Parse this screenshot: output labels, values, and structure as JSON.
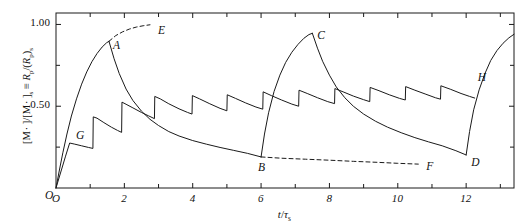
{
  "chart_data": {
    "type": "line",
    "title": "",
    "xlabel": "t/τs",
    "xlabel_parts": {
      "var": "t",
      "slash": "/",
      "tau": "τ",
      "sub": "s"
    },
    "ylabel": "[M · ]/[M · ]s ≡ Rp/(Rp)s",
    "ylabel_parts": {
      "open1": "[M",
      "dot1": "·",
      "close1": " ]/[M",
      "dot2": "·",
      "close2": " ]",
      "sub_s1": "s",
      "equiv": "≡",
      "R1": "R",
      "sub_p1": "p",
      "slash": "/(",
      "R2": "R",
      "sub_p2": "p",
      "close3": ")",
      "sub_s2": "s"
    },
    "xlim": [
      0,
      13.4
    ],
    "ylim": [
      0,
      1.07
    ],
    "xticks_major": [
      0,
      2,
      4,
      6,
      8,
      10,
      12
    ],
    "xticks_minor": [
      1,
      3,
      5,
      7,
      9,
      11,
      13
    ],
    "xtick_labels": [
      "O",
      "2",
      "4",
      "6",
      "8",
      "10",
      "12"
    ],
    "yticks_major": [
      0.5,
      1.0
    ],
    "ytick_labels": [
      "0.50",
      "1.00"
    ],
    "yticks_minor": [
      0.25,
      0.75
    ],
    "grid": false,
    "legend": null,
    "frame": "box",
    "tick_direction": "in",
    "annotations": [
      {
        "label": "O",
        "x": 0.0,
        "y": 0.0,
        "note": "origin"
      },
      {
        "label": "G",
        "x": 0.5,
        "y": 0.275,
        "note": "start of lower sawtooth envelope"
      },
      {
        "label": "A",
        "x": 1.55,
        "y": 0.895,
        "note": "first major peak"
      },
      {
        "label": "E",
        "x": 2.75,
        "y": 1.0,
        "note": "end of dashed ideal curve, segment 1"
      },
      {
        "label": "B",
        "x": 6.0,
        "y": 0.185,
        "note": "minimum before second growth"
      },
      {
        "label": "C",
        "x": 7.5,
        "y": 0.945,
        "note": "second major peak"
      },
      {
        "label": "F",
        "x": 10.6,
        "y": 0.145,
        "note": "end of dashed lower curve"
      },
      {
        "label": "D",
        "x": 12.0,
        "y": 0.2,
        "note": "minimum before third growth"
      },
      {
        "label": "H",
        "x": 12.25,
        "y": 0.625,
        "note": "upper branch marker, third cycle"
      }
    ],
    "series": [
      {
        "name": "main-trace",
        "style": "solid",
        "points": [
          [
            0.0,
            0.0
          ],
          [
            0.28,
            0.195
          ],
          [
            0.4,
            0.275
          ],
          [
            0.55,
            0.268
          ],
          [
            0.75,
            0.258
          ],
          [
            0.95,
            0.248
          ],
          [
            1.08,
            0.242
          ],
          [
            1.09,
            0.435
          ],
          [
            1.2,
            0.427
          ],
          [
            1.4,
            0.4
          ],
          [
            1.62,
            0.372
          ],
          [
            1.8,
            0.352
          ],
          [
            1.92,
            0.34
          ],
          [
            1.93,
            0.525
          ],
          [
            2.05,
            0.512
          ],
          [
            2.25,
            0.49
          ],
          [
            2.5,
            0.462
          ],
          [
            2.7,
            0.442
          ],
          [
            2.88,
            0.424
          ],
          [
            2.89,
            0.56
          ],
          [
            3.05,
            0.545
          ],
          [
            3.3,
            0.515
          ],
          [
            3.6,
            0.484
          ],
          [
            3.85,
            0.462
          ],
          [
            3.98,
            0.452
          ],
          [
            3.99,
            0.565
          ],
          [
            4.2,
            0.545
          ],
          [
            4.5,
            0.515
          ],
          [
            4.8,
            0.487
          ],
          [
            5.0,
            0.472
          ],
          [
            5.01,
            0.57
          ],
          [
            5.25,
            0.548
          ],
          [
            5.55,
            0.52
          ],
          [
            5.85,
            0.495
          ],
          [
            6.05,
            0.482
          ],
          [
            6.06,
            0.588
          ],
          [
            6.3,
            0.565
          ],
          [
            6.6,
            0.538
          ],
          [
            6.9,
            0.513
          ],
          [
            7.1,
            0.5
          ],
          [
            7.11,
            0.598
          ],
          [
            7.35,
            0.578
          ],
          [
            7.65,
            0.552
          ],
          [
            7.95,
            0.528
          ],
          [
            8.15,
            0.516
          ],
          [
            8.16,
            0.608
          ],
          [
            8.4,
            0.588
          ],
          [
            8.7,
            0.562
          ],
          [
            9.0,
            0.54
          ],
          [
            9.18,
            0.528
          ],
          [
            9.19,
            0.615
          ],
          [
            9.45,
            0.595
          ],
          [
            9.75,
            0.57
          ],
          [
            10.05,
            0.548
          ],
          [
            10.22,
            0.538
          ],
          [
            10.23,
            0.62
          ],
          [
            10.5,
            0.598
          ],
          [
            10.8,
            0.575
          ],
          [
            11.1,
            0.552
          ],
          [
            11.25,
            0.543
          ],
          [
            11.26,
            0.625
          ],
          [
            11.55,
            0.603
          ],
          [
            11.85,
            0.578
          ],
          [
            12.1,
            0.56
          ],
          [
            12.25,
            0.55
          ]
        ]
      },
      {
        "name": "growth-branch-1",
        "style": "solid",
        "note": "O to A rising curve",
        "points": [
          [
            0.0,
            0.0
          ],
          [
            0.1,
            0.11
          ],
          [
            0.2,
            0.215
          ],
          [
            0.32,
            0.33
          ],
          [
            0.45,
            0.44
          ],
          [
            0.6,
            0.545
          ],
          [
            0.75,
            0.635
          ],
          [
            0.9,
            0.71
          ],
          [
            1.05,
            0.772
          ],
          [
            1.2,
            0.822
          ],
          [
            1.35,
            0.862
          ],
          [
            1.48,
            0.888
          ],
          [
            1.55,
            0.897
          ]
        ]
      },
      {
        "name": "decay-branch-1",
        "style": "solid",
        "note": "A down to B",
        "points": [
          [
            1.55,
            0.897
          ],
          [
            1.7,
            0.79
          ],
          [
            1.85,
            0.7
          ],
          [
            2.05,
            0.605
          ],
          [
            2.25,
            0.535
          ],
          [
            2.5,
            0.47
          ],
          [
            2.75,
            0.42
          ],
          [
            3.0,
            0.382
          ],
          [
            3.3,
            0.345
          ],
          [
            3.6,
            0.318
          ],
          [
            4.0,
            0.29
          ],
          [
            4.4,
            0.268
          ],
          [
            4.8,
            0.248
          ],
          [
            5.2,
            0.23
          ],
          [
            5.6,
            0.212
          ],
          [
            6.0,
            0.19
          ]
        ]
      },
      {
        "name": "growth-branch-2",
        "style": "solid",
        "note": "B up to C",
        "points": [
          [
            6.0,
            0.19
          ],
          [
            6.1,
            0.33
          ],
          [
            6.22,
            0.46
          ],
          [
            6.38,
            0.59
          ],
          [
            6.55,
            0.69
          ],
          [
            6.72,
            0.768
          ],
          [
            6.9,
            0.83
          ],
          [
            7.08,
            0.878
          ],
          [
            7.25,
            0.915
          ],
          [
            7.4,
            0.938
          ],
          [
            7.5,
            0.946
          ]
        ]
      },
      {
        "name": "decay-branch-2",
        "style": "solid",
        "note": "C down to D",
        "points": [
          [
            7.5,
            0.946
          ],
          [
            7.65,
            0.855
          ],
          [
            7.8,
            0.775
          ],
          [
            8.0,
            0.69
          ],
          [
            8.2,
            0.618
          ],
          [
            8.45,
            0.552
          ],
          [
            8.7,
            0.5
          ],
          [
            9.0,
            0.452
          ],
          [
            9.35,
            0.408
          ],
          [
            9.7,
            0.372
          ],
          [
            10.1,
            0.338
          ],
          [
            10.5,
            0.308
          ],
          [
            10.9,
            0.282
          ],
          [
            11.3,
            0.258
          ],
          [
            11.7,
            0.228
          ],
          [
            12.0,
            0.202
          ]
        ]
      },
      {
        "name": "growth-branch-3",
        "style": "solid",
        "note": "D up toward right edge",
        "points": [
          [
            12.0,
            0.202
          ],
          [
            12.1,
            0.345
          ],
          [
            12.22,
            0.478
          ],
          [
            12.38,
            0.6
          ],
          [
            12.55,
            0.7
          ],
          [
            12.72,
            0.78
          ],
          [
            12.9,
            0.84
          ],
          [
            13.08,
            0.885
          ],
          [
            13.25,
            0.918
          ],
          [
            13.4,
            0.94
          ]
        ]
      },
      {
        "name": "ideal-dashed-upper",
        "style": "dashed",
        "note": "A to E dashed asymptote toward 1.00",
        "points": [
          [
            1.55,
            0.897
          ],
          [
            1.75,
            0.932
          ],
          [
            1.95,
            0.955
          ],
          [
            2.15,
            0.972
          ],
          [
            2.35,
            0.984
          ],
          [
            2.55,
            0.992
          ],
          [
            2.75,
            0.998
          ]
        ]
      },
      {
        "name": "ideal-dashed-lower",
        "style": "dashed",
        "note": "B to F dashed continuation",
        "points": [
          [
            6.0,
            0.19
          ],
          [
            6.6,
            0.182
          ],
          [
            7.3,
            0.176
          ],
          [
            8.0,
            0.17
          ],
          [
            8.7,
            0.163
          ],
          [
            9.4,
            0.157
          ],
          [
            10.0,
            0.151
          ],
          [
            10.6,
            0.146
          ]
        ]
      }
    ]
  },
  "axis": {
    "x_tick_labels": [
      {
        "text": "O",
        "x": 0
      },
      {
        "text": "2",
        "x": 2
      },
      {
        "text": "4",
        "x": 4
      },
      {
        "text": "6",
        "x": 6
      },
      {
        "text": "8",
        "x": 8
      },
      {
        "text": "10",
        "x": 10
      },
      {
        "text": "12",
        "x": 12
      }
    ],
    "y_tick_labels": [
      {
        "text": "1.00",
        "y": 1.0
      },
      {
        "text": "0.50",
        "y": 0.5
      }
    ]
  },
  "colors": {
    "line": "#1a1a1a",
    "axis": "#1a1a1a",
    "background": "#ffffff",
    "text": "#111111"
  }
}
